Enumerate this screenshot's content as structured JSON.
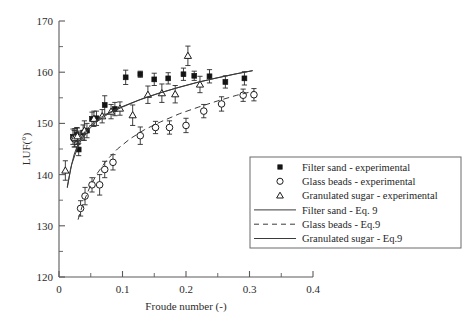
{
  "chart_data": {
    "type": "scatter",
    "title": "",
    "xlabel": "Froude number (-)",
    "ylabel": "LUF(°)",
    "xlim": [
      0,
      0.4
    ],
    "ylim": [
      120,
      170
    ],
    "xticks": [
      0,
      0.1,
      0.2,
      0.3,
      0.4
    ],
    "xticklabels": [
      "0",
      "0.1",
      "0.2",
      "0.3",
      "0.4"
    ],
    "xminor_step": 0.05,
    "yticks": [
      120,
      130,
      140,
      150,
      160,
      170
    ],
    "yticklabels": [
      "120",
      "130",
      "140",
      "150",
      "160",
      "170"
    ],
    "yminor_step": 5,
    "grid": false,
    "legend_position": "lower-right",
    "series": [
      {
        "name": "Filter sand - experimental",
        "marker": "filled-square",
        "kind": "points",
        "points": [
          {
            "x": 0.022,
            "y": 147.4,
            "yerr": 1.5
          },
          {
            "x": 0.028,
            "y": 147.8,
            "yerr": 1.4
          },
          {
            "x": 0.031,
            "y": 144.9,
            "yerr": 1.2
          },
          {
            "x": 0.038,
            "y": 148.2,
            "yerr": 1.5
          },
          {
            "x": 0.044,
            "y": 148.6,
            "yerr": 1.4
          },
          {
            "x": 0.052,
            "y": 150.9,
            "yerr": 1.3
          },
          {
            "x": 0.059,
            "y": 151.0,
            "yerr": 1.4
          },
          {
            "x": 0.072,
            "y": 153.6,
            "yerr": 1.8
          },
          {
            "x": 0.088,
            "y": 152.8,
            "yerr": 1.3
          },
          {
            "x": 0.105,
            "y": 159.0,
            "yerr": 1.4
          },
          {
            "x": 0.128,
            "y": 159.6,
            "yerr": 0.6
          },
          {
            "x": 0.15,
            "y": 158.6,
            "yerr": 1.2
          },
          {
            "x": 0.172,
            "y": 158.8,
            "yerr": 1.1
          },
          {
            "x": 0.196,
            "y": 159.6,
            "yerr": 1.2
          },
          {
            "x": 0.213,
            "y": 159.3,
            "yerr": 0.9
          },
          {
            "x": 0.237,
            "y": 159.2,
            "yerr": 1.3
          },
          {
            "x": 0.262,
            "y": 158.1,
            "yerr": 1.2
          },
          {
            "x": 0.292,
            "y": 158.8,
            "yerr": 1.3
          }
        ]
      },
      {
        "name": "Glass beads - experimental",
        "marker": "open-circle",
        "kind": "points",
        "points": [
          {
            "x": 0.024,
            "y": 147.0,
            "yerr": 1.6
          },
          {
            "x": 0.03,
            "y": 147.2,
            "yerr": 1.3
          },
          {
            "x": 0.034,
            "y": 133.4,
            "yerr": 1.5
          },
          {
            "x": 0.041,
            "y": 135.8,
            "yerr": 1.7
          },
          {
            "x": 0.052,
            "y": 138.0,
            "yerr": 1.4
          },
          {
            "x": 0.064,
            "y": 138.0,
            "yerr": 2.0
          },
          {
            "x": 0.072,
            "y": 141.0,
            "yerr": 1.6
          },
          {
            "x": 0.085,
            "y": 142.4,
            "yerr": 1.5
          },
          {
            "x": 0.128,
            "y": 147.6,
            "yerr": 1.7
          },
          {
            "x": 0.152,
            "y": 149.2,
            "yerr": 1.2
          },
          {
            "x": 0.174,
            "y": 149.2,
            "yerr": 1.3
          },
          {
            "x": 0.2,
            "y": 149.6,
            "yerr": 1.4
          },
          {
            "x": 0.228,
            "y": 152.4,
            "yerr": 1.3
          },
          {
            "x": 0.256,
            "y": 153.8,
            "yerr": 1.4
          },
          {
            "x": 0.29,
            "y": 155.5,
            "yerr": 1.2
          },
          {
            "x": 0.307,
            "y": 155.6,
            "yerr": 1.2
          }
        ]
      },
      {
        "name": "Granulated sugar - experimental",
        "marker": "open-triangle",
        "kind": "points",
        "points": [
          {
            "x": 0.01,
            "y": 140.8,
            "yerr": 1.9
          },
          {
            "x": 0.025,
            "y": 147.2,
            "yerr": 1.8
          },
          {
            "x": 0.029,
            "y": 147.5,
            "yerr": 1.6
          },
          {
            "x": 0.04,
            "y": 148.6,
            "yerr": 1.9
          },
          {
            "x": 0.055,
            "y": 150.9,
            "yerr": 1.5
          },
          {
            "x": 0.068,
            "y": 151.4,
            "yerr": 1.3
          },
          {
            "x": 0.082,
            "y": 152.3,
            "yerr": 1.4
          },
          {
            "x": 0.096,
            "y": 152.9,
            "yerr": 1.3
          },
          {
            "x": 0.116,
            "y": 151.6,
            "yerr": 2.0
          },
          {
            "x": 0.14,
            "y": 155.6,
            "yerr": 1.7
          },
          {
            "x": 0.162,
            "y": 155.9,
            "yerr": 1.8
          },
          {
            "x": 0.183,
            "y": 155.7,
            "yerr": 1.7
          },
          {
            "x": 0.203,
            "y": 163.2,
            "yerr": 1.9
          },
          {
            "x": 0.222,
            "y": 157.6,
            "yerr": 1.6
          }
        ]
      },
      {
        "name": "Filter sand - Eq. 9",
        "kind": "curve",
        "style": "solid",
        "x": [
          0.013,
          0.018,
          0.024,
          0.032,
          0.042,
          0.055,
          0.07,
          0.09,
          0.11,
          0.135,
          0.16,
          0.19,
          0.22,
          0.25,
          0.28,
          0.305
        ],
        "y": [
          137.4,
          141.0,
          144.0,
          146.6,
          148.6,
          150.2,
          151.5,
          152.8,
          153.8,
          155.0,
          156.0,
          157.1,
          158.1,
          158.9,
          159.7,
          160.3
        ]
      },
      {
        "name": "Glass beads - Eq.9",
        "kind": "curve",
        "style": "dashed",
        "x": [
          0.03,
          0.038,
          0.048,
          0.06,
          0.075,
          0.092,
          0.112,
          0.135,
          0.16,
          0.19,
          0.22,
          0.25,
          0.28,
          0.307
        ],
        "y": [
          131.2,
          134.4,
          137.4,
          140.2,
          142.8,
          145.0,
          147.0,
          148.8,
          150.3,
          151.9,
          153.2,
          154.4,
          155.5,
          156.3
        ]
      },
      {
        "name": "Granulated sugar - Eq.9",
        "kind": "curve",
        "style": "solid",
        "x": [
          0.013,
          0.02,
          0.03,
          0.042,
          0.058,
          0.078,
          0.1,
          0.125,
          0.155,
          0.185,
          0.215,
          0.245,
          0.275,
          0.305
        ],
        "y": [
          137.6,
          142.0,
          145.6,
          148.2,
          150.2,
          151.9,
          153.2,
          154.5,
          155.8,
          156.9,
          157.9,
          158.8,
          159.6,
          160.3
        ]
      }
    ]
  },
  "legend": {
    "entries": [
      {
        "label": "Filter sand - experimental",
        "symbol": "filled-square"
      },
      {
        "label": "Glass beads - experimental",
        "symbol": "open-circle"
      },
      {
        "label": "Granulated sugar - experimental",
        "symbol": "open-triangle"
      },
      {
        "label": "Filter sand - Eq. 9",
        "symbol": "solid-line"
      },
      {
        "label": "Glass beads - Eq.9",
        "symbol": "dashed-line"
      },
      {
        "label": "Granulated sugar - Eq.9",
        "symbol": "solid-line"
      }
    ]
  },
  "colors": {
    "axis": "#5a5a5a",
    "marker": "#1d1d1d",
    "curve": "#3a3a3a",
    "background": "#ffffff"
  }
}
